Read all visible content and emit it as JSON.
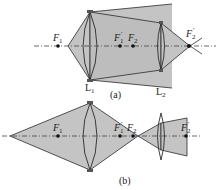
{
  "diagram_a": {
    "caption": "(a)",
    "labels": {
      "F1": "F",
      "F1_sub": "1",
      "F1p": "F",
      "F1p_sub": "1",
      "F1p_prime": "′",
      "F2": "F",
      "F2_sub": "2",
      "F2p": "F",
      "F2p_sub": "2",
      "F2p_prime": "′",
      "L1": "L",
      "L1_sub": "1",
      "L2": "L",
      "L2_sub": "2"
    }
  },
  "diagram_b": {
    "caption": "(b)",
    "labels": {
      "F1": "F",
      "F1_sub": "1",
      "F1p": "F",
      "F1p_sub": "1",
      "F1p_prime": "′",
      "F2": "F",
      "F2_sub": "2",
      "F2p": "F",
      "F2p_sub": "2",
      "F2p_prime": "′"
    }
  },
  "colors": {
    "shade": "#c4c4c4",
    "line": "#2a2a2a",
    "axis": "#444444"
  }
}
